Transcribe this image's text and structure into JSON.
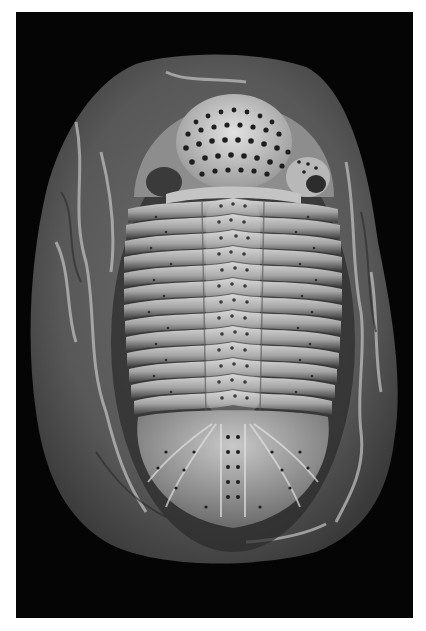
{
  "image": {
    "subject": "Trilobite fossil in rock matrix",
    "alt": "Black-and-white photograph of a pitted trilobite fossil embedded in an oval rock matrix on a black background",
    "colors": {
      "frame": "#ffffff",
      "background": "#050505",
      "matrix": "#5a5a5a",
      "matrix_vein": "#bdbdbd",
      "shell": "#a9a9a9",
      "shell_highlight": "#d8d8d8",
      "pits": "#1e1e1e"
    },
    "thoracic_segments": 13
  }
}
